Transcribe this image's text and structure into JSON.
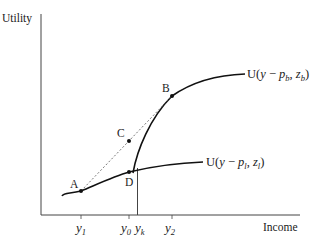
{
  "axes": {
    "y_label": "Utility",
    "x_label": "Income"
  },
  "x_ticks": [
    {
      "id": "y1",
      "base": "y",
      "sub": "1"
    },
    {
      "id": "y0",
      "base": "y",
      "sub": "0"
    },
    {
      "id": "yk",
      "base": "y",
      "sub": "k"
    },
    {
      "id": "y2",
      "base": "y",
      "sub": "2"
    }
  ],
  "curves": [
    {
      "id": "high",
      "label_prefix": "U(",
      "label_var": "y",
      "label_minus": " − ",
      "label_p": "p",
      "label_p_sub": "b",
      "label_comma": ", ",
      "label_z": "z",
      "label_z_sub": "b",
      "label_close": ")"
    },
    {
      "id": "low",
      "label_prefix": "U(",
      "label_var": "y",
      "label_minus": " − ",
      "label_p": "p",
      "label_p_sub": "l",
      "label_comma": ", ",
      "label_z": "z",
      "label_z_sub": "l",
      "label_close": ")"
    }
  ],
  "points": [
    {
      "id": "A",
      "label": "A"
    },
    {
      "id": "B",
      "label": "B"
    },
    {
      "id": "C",
      "label": "C"
    },
    {
      "id": "D",
      "label": "D"
    }
  ],
  "colors": {
    "curve": "#111111",
    "axis": "#444444",
    "chord": "#555555"
  }
}
